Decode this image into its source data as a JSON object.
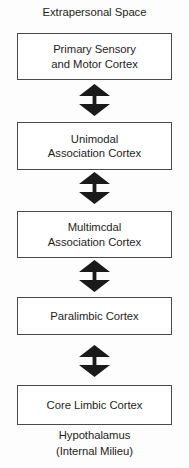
{
  "diagram": {
    "title": "Extrapersonal Space",
    "footer": {
      "line1": "Hypothalamus",
      "line2": "(Internal Milieu)"
    },
    "colors": {
      "background": "#fdfdfd",
      "box_fill": "#ffffff",
      "box_border": "#4a4a4a",
      "text": "#1e1e1e",
      "arrow": "#1a1a1a"
    },
    "nodes": [
      {
        "line1": "Primary Sensory",
        "line2": "and Motor Cortex"
      },
      {
        "line1": "Unimodal",
        "line2": "Association Cortex"
      },
      {
        "line1": "Multimcdal",
        "line2": "Association Cortex"
      },
      {
        "line1": "Paralimbic Cortex",
        "line2": ""
      },
      {
        "line1": "Core Limbic Cortex",
        "line2": ""
      }
    ],
    "connectors": [
      {
        "icon": "double-headed-vertical-arrow-icon"
      },
      {
        "icon": "double-headed-vertical-arrow-icon"
      },
      {
        "icon": "double-headed-vertical-arrow-icon"
      },
      {
        "icon": "double-headed-vertical-arrow-icon"
      }
    ]
  }
}
